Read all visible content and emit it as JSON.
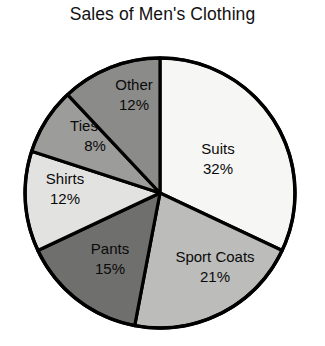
{
  "chart_data": {
    "type": "pie",
    "title": "Sales of Men's Clothing",
    "xlabel": "",
    "ylabel": "",
    "legend": "none",
    "grid": false,
    "value_unit": "%",
    "start_angle_deg": 0,
    "direction": "clockwise",
    "categories": [
      "Suits",
      "Sport Coats",
      "Pants",
      "Shirts",
      "Ties",
      "Other"
    ],
    "values": [
      32,
      21,
      15,
      12,
      8,
      12
    ],
    "total": 100,
    "slices": [
      {
        "label": "Suits",
        "value": 32,
        "value_label": "32%",
        "color": "#f6f6f4",
        "label_x": 218,
        "label_y": 150,
        "value_x": 218,
        "value_y": 170
      },
      {
        "label": "Sport Coats",
        "value": 21,
        "value_label": "21%",
        "color": "#bcbcba",
        "label_x": 215,
        "label_y": 258,
        "value_x": 215,
        "value_y": 278
      },
      {
        "label": "Pants",
        "value": 15,
        "value_label": "15%",
        "color": "#6f6f6d",
        "label_x": 110,
        "label_y": 250,
        "value_x": 110,
        "value_y": 270
      },
      {
        "label": "Shirts",
        "value": 12,
        "value_label": "12%",
        "color": "#e2e2e0",
        "label_x": 65,
        "label_y": 180,
        "value_x": 65,
        "value_y": 200
      },
      {
        "label": "Ties",
        "value": 8,
        "value_label": "8%",
        "color": "#9c9c9a",
        "label_x": 84,
        "label_y": 127,
        "value_x": 95,
        "value_y": 147
      },
      {
        "label": "Other",
        "value": 12,
        "value_label": "12%",
        "color": "#8b8b89",
        "label_x": 134,
        "label_y": 86,
        "value_x": 134,
        "value_y": 106
      }
    ]
  },
  "figure": {
    "title": "Sales of Men's Clothing",
    "center_x": 160,
    "center_y": 193,
    "radius": 135,
    "background": "#ffffff",
    "outline_color": "#000000"
  }
}
